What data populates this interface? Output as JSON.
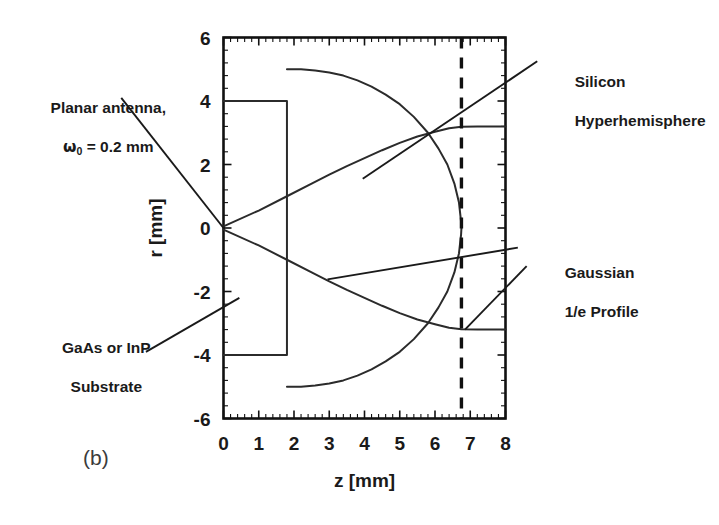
{
  "panel": {
    "label": "(b)"
  },
  "annotations": {
    "antenna": {
      "line1": "Planar antenna,",
      "omega": "ω",
      "subscript": "0",
      "rest": " = 0.2 mm"
    },
    "silicon": {
      "line1": "Silicon",
      "line2": "Hyperhemisphere"
    },
    "gaussian": {
      "line1": "Gaussian",
      "line2": "1/e Profile"
    },
    "substrate": {
      "line1": "GaAs or InP",
      "line2": "Substrate"
    }
  },
  "colors": {
    "ink": "#1a1a1a",
    "frame": "#111111",
    "curve": "#2b2b2b",
    "background": "#ffffff"
  },
  "chart_data": {
    "type": "line",
    "title": "",
    "xlabel": "z [mm]",
    "ylabel": "r [mm]",
    "xlim": [
      0,
      8
    ],
    "ylim": [
      -6,
      6
    ],
    "xticks": [
      0,
      1,
      2,
      3,
      4,
      5,
      6,
      7,
      8
    ],
    "yticks": [
      -6,
      -4,
      -2,
      0,
      2,
      4,
      6
    ],
    "xtick_labels": [
      "0",
      "1",
      "2",
      "3",
      "4",
      "5",
      "6",
      "7",
      "8"
    ],
    "ytick_labels": [
      "-6",
      "-4",
      "-2",
      "0",
      "2",
      "4",
      "6"
    ],
    "minor_ticks_per_major": 5,
    "grid": false,
    "legend": "none",
    "series": [
      {
        "name": "GaAs or InP Substrate outline",
        "type": "polyline",
        "points": [
          [
            0,
            4
          ],
          [
            1.8,
            4
          ],
          [
            1.8,
            -4
          ],
          [
            0,
            -4
          ]
        ]
      },
      {
        "name": "Silicon hyperhemisphere outline",
        "type": "polyline",
        "points": [
          [
            1.8,
            5
          ],
          [
            2.2,
            5.0
          ],
          [
            2.6,
            4.96
          ],
          [
            3.0,
            4.9
          ],
          [
            3.4,
            4.8
          ],
          [
            3.8,
            4.65
          ],
          [
            4.2,
            4.45
          ],
          [
            4.6,
            4.2
          ],
          [
            5.0,
            3.9
          ],
          [
            5.4,
            3.5
          ],
          [
            5.8,
            3.0
          ],
          [
            6.1,
            2.5
          ],
          [
            6.35,
            2.0
          ],
          [
            6.55,
            1.4
          ],
          [
            6.68,
            0.8
          ],
          [
            6.74,
            0.2
          ],
          [
            6.75,
            0
          ],
          [
            6.74,
            -0.2
          ],
          [
            6.68,
            -0.8
          ],
          [
            6.55,
            -1.4
          ],
          [
            6.35,
            -2.0
          ],
          [
            6.1,
            -2.5
          ],
          [
            5.8,
            -3.0
          ],
          [
            5.4,
            -3.5
          ],
          [
            5.0,
            -3.9
          ],
          [
            4.6,
            -4.2
          ],
          [
            4.2,
            -4.45
          ],
          [
            3.8,
            -4.65
          ],
          [
            3.4,
            -4.8
          ],
          [
            3.0,
            -4.9
          ],
          [
            2.6,
            -4.96
          ],
          [
            2.2,
            -5.0
          ],
          [
            1.8,
            -5
          ]
        ]
      },
      {
        "name": "Gaussian 1/e profile (upper)",
        "type": "polyline",
        "points": [
          [
            0,
            0.05
          ],
          [
            1.0,
            0.55
          ],
          [
            1.8,
            1.0
          ],
          [
            2.5,
            1.4
          ],
          [
            3.0,
            1.68
          ],
          [
            3.5,
            1.95
          ],
          [
            4.0,
            2.2
          ],
          [
            4.5,
            2.45
          ],
          [
            5.0,
            2.68
          ],
          [
            5.5,
            2.88
          ],
          [
            6.0,
            3.03
          ],
          [
            6.4,
            3.14
          ],
          [
            6.75,
            3.19
          ],
          [
            7.2,
            3.2
          ],
          [
            8.0,
            3.2
          ]
        ]
      },
      {
        "name": "Gaussian 1/e profile (lower)",
        "type": "polyline",
        "points": [
          [
            0,
            -0.05
          ],
          [
            1.0,
            -0.55
          ],
          [
            1.8,
            -1.0
          ],
          [
            2.5,
            -1.4
          ],
          [
            3.0,
            -1.68
          ],
          [
            3.5,
            -1.95
          ],
          [
            4.0,
            -2.2
          ],
          [
            4.5,
            -2.45
          ],
          [
            5.0,
            -2.68
          ],
          [
            5.5,
            -2.88
          ],
          [
            6.0,
            -3.03
          ],
          [
            6.4,
            -3.14
          ],
          [
            6.75,
            -3.19
          ],
          [
            7.2,
            -3.2
          ],
          [
            8.0,
            -3.2
          ]
        ]
      },
      {
        "name": "Focal plane marker",
        "type": "vline-dashed",
        "x": 6.75,
        "y_range": [
          -6,
          6
        ]
      }
    ],
    "leader_lines": [
      {
        "name": "antenna-leader",
        "from": [
          -2.9,
          4.1
        ],
        "to": [
          0.0,
          0.0
        ]
      },
      {
        "name": "silicon-leader",
        "from": [
          8.9,
          5.25
        ],
        "to": [
          3.95,
          1.55
        ]
      },
      {
        "name": "gaussian-leader-upper",
        "from": [
          8.35,
          -0.62
        ],
        "to": [
          2.95,
          -1.62
        ]
      },
      {
        "name": "gaussian-leader-lower",
        "from": [
          8.6,
          -1.2
        ],
        "to": [
          6.85,
          -3.2
        ]
      },
      {
        "name": "substrate-leader",
        "from": [
          -2.2,
          -3.9
        ],
        "to": [
          0.45,
          -2.2
        ]
      }
    ]
  }
}
